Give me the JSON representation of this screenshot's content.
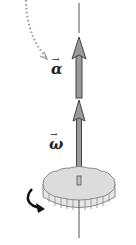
{
  "diagram": {
    "labels": {
      "alpha": "α",
      "omega": "ω",
      "vector_arrow": "→"
    },
    "colors": {
      "axis": "#555555",
      "vector_fill": "#9a9a9a",
      "vector_stroke": "#444444",
      "gear_fill": "#dcdcdc",
      "gear_stroke": "#8a8a8a",
      "dotted_arrow": "#999999",
      "rotation_arrow": "#111111"
    }
  }
}
